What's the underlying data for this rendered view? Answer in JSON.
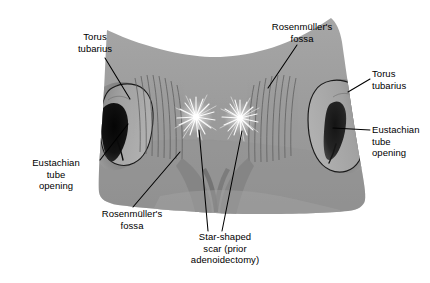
{
  "figure": {
    "width": 430,
    "height": 283,
    "background_color": "#ffffff",
    "mucosa_color": "#9d9d9d",
    "mucosa_shadow_color": "#6f6f6f",
    "outline_color": "#000000",
    "scar_color": "#ffffff"
  },
  "labels": [
    {
      "id": "torus-tubarius-left",
      "line1": "Torus",
      "line2": "tubarius",
      "align": "center"
    },
    {
      "id": "rosenmuller-fossa-top-right",
      "line1": "Rosenmüller's",
      "line2": "fossa",
      "align": "center"
    },
    {
      "id": "torus-tubarius-right",
      "line1": "Torus",
      "line2": "tubarius",
      "align": "left"
    },
    {
      "id": "eustachian-tube-opening-right",
      "line1": "Eustachian",
      "line2": "tube",
      "line3": "opening",
      "align": "left"
    },
    {
      "id": "eustachian-tube-opening-left",
      "line1": "Eustachian",
      "line2": "tube",
      "line3": "opening",
      "align": "center"
    },
    {
      "id": "rosenmuller-fossa-bottom-left",
      "line1": "Rosenmüller's",
      "line2": "fossa",
      "align": "center"
    },
    {
      "id": "star-shaped-scar",
      "line1": "Star-shaped",
      "line2": "scar (prior",
      "line3": "adenoidectomy)",
      "align": "center"
    }
  ],
  "label_text": {
    "torus_left_1": "Torus",
    "torus_left_2": "tubarius",
    "rosen_top_1": "Rosenmüller's",
    "rosen_top_2": "fossa",
    "torus_right_1": "Torus",
    "torus_right_2": "tubarius",
    "eust_right_1": "Eustachian",
    "eust_right_2": "tube",
    "eust_right_3": "opening",
    "eust_left_1": "Eustachian",
    "eust_left_2": "tube",
    "eust_left_3": "opening",
    "rosen_bottom_1": "Rosenmüller's",
    "rosen_bottom_2": "fossa",
    "scar_1": "Star-shaped",
    "scar_2": "scar (prior",
    "scar_3": "adenoidectomy)"
  },
  "structures": [
    {
      "name": "torus-tubarius-left",
      "side": "left"
    },
    {
      "name": "torus-tubarius-right",
      "side": "right"
    },
    {
      "name": "eustachian-tube-opening-left",
      "side": "left"
    },
    {
      "name": "eustachian-tube-opening-right",
      "side": "right"
    },
    {
      "name": "rosenmuller-fossa-left",
      "side": "left"
    },
    {
      "name": "rosenmuller-fossa-right",
      "side": "right"
    },
    {
      "name": "star-shaped-scar-left",
      "side": "center-left"
    },
    {
      "name": "star-shaped-scar-right",
      "side": "center-right"
    }
  ]
}
